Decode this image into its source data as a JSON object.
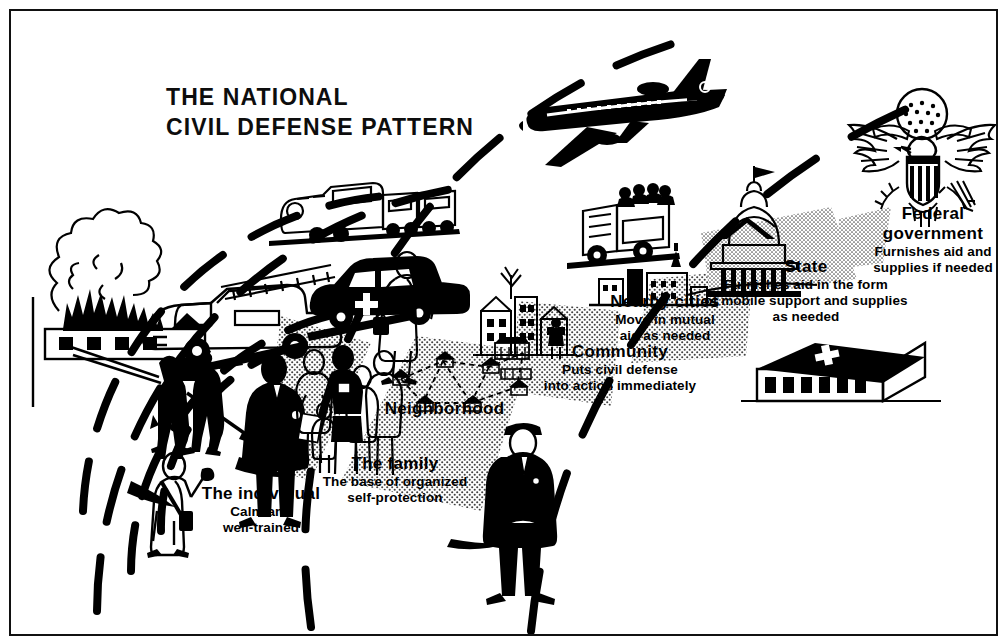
{
  "poster": {
    "title_line1": "THE NATIONAL",
    "title_line2": "CIVIL DEFENSE PATTERN",
    "background_color": "#ffffff",
    "ink_color": "#000000"
  },
  "labels": {
    "individual": {
      "heading": "The individual",
      "line1": "Calm and",
      "line2": "well-trained"
    },
    "family": {
      "heading": "The family",
      "line1": "The base of organized",
      "line2": "self-protection"
    },
    "neighborhood": {
      "heading": "Neighborhood",
      "line1": "",
      "line2": ""
    },
    "community": {
      "heading": "Community",
      "line1": "Puts civil defense",
      "line2": "into action immediately"
    },
    "nearby_cities": {
      "heading": "Nearby cities",
      "line1": "Move in mutual",
      "line2": "aid as needed"
    },
    "state": {
      "heading": "State",
      "line1": "Furnishes aid in the form",
      "line2": "of mobile support and supplies",
      "line3": "as needed"
    },
    "federal": {
      "heading_line1": "Federal",
      "heading_line2": "government",
      "line1": "Furnishes aid and",
      "line2": "supplies if needed"
    }
  },
  "illustrations": [
    {
      "name": "burning-building-with-smoke"
    },
    {
      "name": "firefighters-with-hose"
    },
    {
      "name": "fire-engine-with-ladder"
    },
    {
      "name": "ambulance-with-cross"
    },
    {
      "name": "nurse-with-bag"
    },
    {
      "name": "civil-defense-individual-with-armband"
    },
    {
      "name": "warden-with-clipboard"
    },
    {
      "name": "family-group-of-five"
    },
    {
      "name": "neighborhood-houses-network"
    },
    {
      "name": "community-town-buildings"
    },
    {
      "name": "police-warden-officer"
    },
    {
      "name": "nearby-cities-skyline"
    },
    {
      "name": "rescue-truck-with-crew"
    },
    {
      "name": "passenger-train"
    },
    {
      "name": "jet-airliner"
    },
    {
      "name": "state-capitol-dome"
    },
    {
      "name": "great-seal-eagle"
    },
    {
      "name": "supply-depot-building-with-cross"
    }
  ],
  "structure": {
    "arc_count": 6,
    "arc_style": "dashed",
    "origin": "lower-left (the individual)",
    "direction": "expanding outward toward upper-right (federal government)"
  }
}
